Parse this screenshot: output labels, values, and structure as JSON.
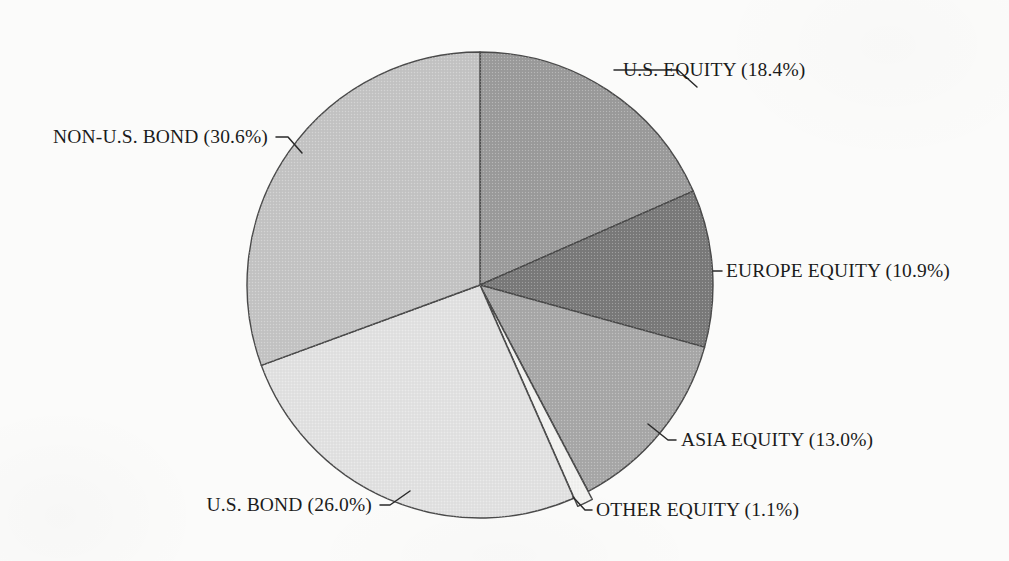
{
  "figure": {
    "background_color": "#fbfbfa",
    "ink_color": "#1b1b1b",
    "outline_color": "#4a4a4a"
  },
  "chart_data": {
    "type": "pie",
    "title": "",
    "subtitle": "",
    "xlabel": "",
    "ylabel": "",
    "legend_position": "none",
    "labels_position": "outside-with-leader-lines",
    "start_angle_deg": 90,
    "direction": "clockwise",
    "center": {
      "x": 480,
      "y": 285
    },
    "radius": 233,
    "categories": [
      "U.S. EQUITY",
      "EUROPE EQUITY",
      "ASIA EQUITY",
      "OTHER EQUITY",
      "U.S. BOND",
      "NON-U.S. BOND"
    ],
    "values": [
      18.4,
      10.9,
      13.0,
      1.1,
      26.0,
      30.6
    ],
    "units": "percent",
    "total": 100.0,
    "slices": [
      {
        "name": "U.S. EQUITY",
        "label": "U.S. EQUITY (18.4%)",
        "value": 18.4,
        "value_text": "18.4%",
        "sweep_deg": 66.24,
        "start_deg": 0.0,
        "end_deg": 66.24,
        "color": "#9b9b9b",
        "exploded": false,
        "label_anchor": "start",
        "label_x": 623,
        "label_y": 76,
        "leader": "M 697 87 L 678 70 L 614 70"
      },
      {
        "name": "EUROPE EQUITY",
        "label": "EUROPE EQUITY (10.9%)",
        "value": 10.9,
        "value_text": "10.9%",
        "sweep_deg": 39.24,
        "start_deg": 66.24,
        "end_deg": 105.48,
        "color": "#7a7a7a",
        "exploded": false,
        "label_anchor": "start",
        "label_x": 726,
        "label_y": 277,
        "leader": "M 713 271 L 722 271"
      },
      {
        "name": "ASIA EQUITY",
        "label": "ASIA EQUITY (13.0%)",
        "value": 13.0,
        "value_text": "13.0%",
        "sweep_deg": 46.8,
        "start_deg": 105.48,
        "end_deg": 152.28,
        "color": "#a8a8a8",
        "exploded": false,
        "label_anchor": "start",
        "label_x": 681,
        "label_y": 446,
        "leader": "M 648 424 L 668 440 L 676 440"
      },
      {
        "name": "OTHER EQUITY",
        "label": "OTHER EQUITY (1.1%)",
        "value": 1.1,
        "value_text": "1.1%",
        "sweep_deg": 3.96,
        "start_deg": 152.28,
        "end_deg": 156.24,
        "color": "#f2f2f0",
        "exploded": true,
        "explode_offset": 9,
        "label_anchor": "start",
        "label_x": 596,
        "label_y": 516,
        "leader": "M 573 497 L 585 510 L 592 510"
      },
      {
        "name": "U.S. BOND",
        "label": "U.S. BOND (26.0%)",
        "value": 26.0,
        "value_text": "26.0%",
        "sweep_deg": 93.6,
        "start_deg": 156.24,
        "end_deg": 249.84,
        "color": "#e2e2e2",
        "exploded": false,
        "label_anchor": "end",
        "label_y": 511,
        "label_x": 372,
        "leader": "M 410 491 L 390 505 L 380 505"
      },
      {
        "name": "NON-U.S. BOND",
        "label": "NON-U.S. BOND (30.6%)",
        "value": 30.6,
        "value_text": "30.6%",
        "sweep_deg": 110.16,
        "start_deg": 249.84,
        "end_deg": 360.0,
        "color": "#c4c4c4",
        "exploded": false,
        "label_anchor": "end",
        "label_x": 268,
        "label_y": 143,
        "leader": "M 302 153 L 288 137 L 276 137"
      }
    ]
  }
}
